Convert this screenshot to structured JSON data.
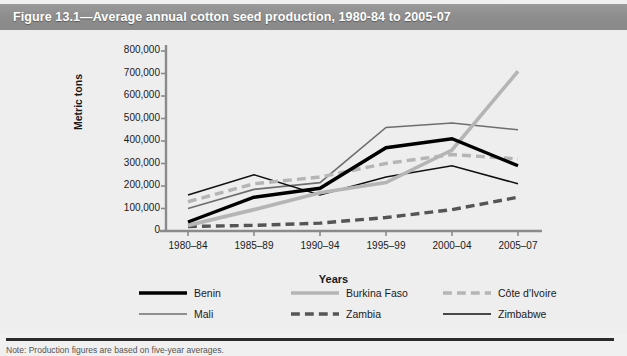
{
  "figure": {
    "title": "Figure 13.1—Average annual cotton seed production, 1980-84 to 2005-07",
    "note": "Note: Production figures are based on five-year averages.",
    "header_color": "#8c8c8c",
    "background_color": "#eeeeee"
  },
  "chart_data": {
    "type": "line",
    "title": "Figure 13.1—Average annual cotton seed production, 1980-84 to 2005-07",
    "xlabel": "Years",
    "ylabel": "Metric tons",
    "categories": [
      "1980–84",
      "1985–89",
      "1990–94",
      "1995–99",
      "2000–04",
      "2005–07"
    ],
    "ylim": [
      0,
      800000
    ],
    "yticks": [
      0,
      100000,
      200000,
      300000,
      400000,
      500000,
      600000,
      700000,
      800000
    ],
    "ytick_labels": [
      "0",
      "100,000",
      "200,000",
      "300,000",
      "400,000",
      "500,000",
      "600,000",
      "700,000",
      "800,000"
    ],
    "grid": false,
    "legend_position": "bottom",
    "series": [
      {
        "name": "Benin",
        "color": "#000000",
        "width": 3.4,
        "dash": "none",
        "values": [
          40000,
          150000,
          190000,
          370000,
          410000,
          290000
        ]
      },
      {
        "name": "Burkina Faso",
        "color": "#b5b5b5",
        "width": 3.6,
        "dash": "none",
        "values": [
          25000,
          95000,
          170000,
          215000,
          360000,
          710000
        ]
      },
      {
        "name": "Côte d'Ivoire",
        "color": "#b5b5b5",
        "width": 3.4,
        "dash": "dashed",
        "values": [
          130000,
          210000,
          240000,
          300000,
          340000,
          320000
        ]
      },
      {
        "name": "Mali",
        "color": "#6e6e6e",
        "width": 1.6,
        "dash": "none",
        "values": [
          100000,
          185000,
          215000,
          460000,
          480000,
          450000
        ]
      },
      {
        "name": "Zambia",
        "color": "#555555",
        "width": 3.4,
        "dash": "dashed",
        "values": [
          20000,
          25000,
          35000,
          60000,
          95000,
          150000
        ]
      },
      {
        "name": "Zimbabwe",
        "color": "#111111",
        "width": 1.6,
        "dash": "none",
        "values": [
          160000,
          250000,
          160000,
          240000,
          290000,
          210000
        ]
      }
    ]
  }
}
